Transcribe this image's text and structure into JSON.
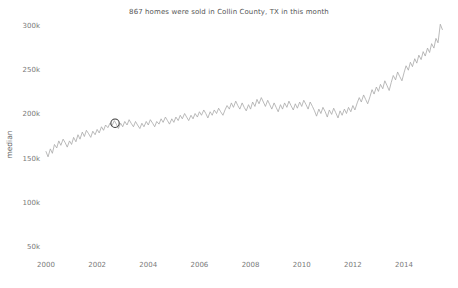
{
  "chart_data": {
    "type": "line",
    "title": "867 homes were sold in Collin County, TX in this month",
    "xlabel": "",
    "ylabel": "median",
    "grid": false,
    "legend": null,
    "xlim": [
      2000.0,
      2015.6
    ],
    "ylim": [
      50000,
      310000
    ],
    "ytick_labels": [
      "300k",
      "250k",
      "200k",
      "150k",
      "100k",
      "50k"
    ],
    "ytick_values": [
      300000,
      250000,
      200000,
      150000,
      100000,
      50000
    ],
    "xtick_labels": [
      "2000",
      "2002",
      "2004",
      "2006",
      "2008",
      "2010",
      "2012",
      "2014"
    ],
    "xtick_values": [
      2000,
      2002,
      2004,
      2006,
      2008,
      2010,
      2012,
      2014
    ],
    "line_color": "#a8a8a8",
    "marker_color": "#3b3b3b",
    "title_color": "#555555",
    "tick_color": "#7a7a7a",
    "highlight_point": {
      "x": 2002.7,
      "y": 190000,
      "shape": "open-circle"
    },
    "x": [
      2000.0,
      2000.08,
      2000.17,
      2000.25,
      2000.33,
      2000.42,
      2000.5,
      2000.58,
      2000.67,
      2000.75,
      2000.83,
      2000.92,
      2001.0,
      2001.08,
      2001.17,
      2001.25,
      2001.33,
      2001.42,
      2001.5,
      2001.58,
      2001.67,
      2001.75,
      2001.83,
      2001.92,
      2002.0,
      2002.08,
      2002.17,
      2002.25,
      2002.33,
      2002.42,
      2002.5,
      2002.58,
      2002.67,
      2002.75,
      2002.83,
      2002.92,
      2003.0,
      2003.08,
      2003.17,
      2003.25,
      2003.33,
      2003.42,
      2003.5,
      2003.58,
      2003.67,
      2003.75,
      2003.83,
      2003.92,
      2004.0,
      2004.08,
      2004.17,
      2004.25,
      2004.33,
      2004.42,
      2004.5,
      2004.58,
      2004.67,
      2004.75,
      2004.83,
      2004.92,
      2005.0,
      2005.08,
      2005.17,
      2005.25,
      2005.33,
      2005.42,
      2005.5,
      2005.58,
      2005.67,
      2005.75,
      2005.83,
      2005.92,
      2006.0,
      2006.08,
      2006.17,
      2006.25,
      2006.33,
      2006.42,
      2006.5,
      2006.58,
      2006.67,
      2006.75,
      2006.83,
      2006.92,
      2007.0,
      2007.08,
      2007.17,
      2007.25,
      2007.33,
      2007.42,
      2007.5,
      2007.58,
      2007.67,
      2007.75,
      2007.83,
      2007.92,
      2008.0,
      2008.08,
      2008.17,
      2008.25,
      2008.33,
      2008.42,
      2008.5,
      2008.58,
      2008.67,
      2008.75,
      2008.83,
      2008.92,
      2009.0,
      2009.08,
      2009.17,
      2009.25,
      2009.33,
      2009.42,
      2009.5,
      2009.58,
      2009.67,
      2009.75,
      2009.83,
      2009.92,
      2010.0,
      2010.08,
      2010.17,
      2010.25,
      2010.33,
      2010.42,
      2010.5,
      2010.58,
      2010.67,
      2010.75,
      2010.83,
      2010.92,
      2011.0,
      2011.08,
      2011.17,
      2011.25,
      2011.33,
      2011.42,
      2011.5,
      2011.58,
      2011.67,
      2011.75,
      2011.83,
      2011.92,
      2012.0,
      2012.08,
      2012.17,
      2012.25,
      2012.33,
      2012.42,
      2012.5,
      2012.58,
      2012.67,
      2012.75,
      2012.83,
      2012.92,
      2013.0,
      2013.08,
      2013.17,
      2013.25,
      2013.33,
      2013.42,
      2013.5,
      2013.58,
      2013.67,
      2013.75,
      2013.83,
      2013.92,
      2014.0,
      2014.08,
      2014.17,
      2014.25,
      2014.33,
      2014.42,
      2014.5,
      2014.58,
      2014.67,
      2014.75,
      2014.83,
      2014.92,
      2015.0,
      2015.08,
      2015.17,
      2015.25,
      2015.33,
      2015.42,
      2015.5
    ],
    "y": [
      158000,
      152000,
      161000,
      156000,
      166000,
      162000,
      170000,
      165000,
      172000,
      168000,
      163000,
      170000,
      166000,
      174000,
      169000,
      177000,
      172000,
      180000,
      175000,
      182000,
      178000,
      174000,
      181000,
      177000,
      183000,
      179000,
      186000,
      182000,
      188000,
      185000,
      190000,
      187000,
      193000,
      189000,
      184000,
      190000,
      186000,
      192000,
      188000,
      194000,
      190000,
      186000,
      192000,
      188000,
      184000,
      190000,
      186000,
      192000,
      188000,
      194000,
      190000,
      186000,
      192000,
      189000,
      195000,
      191000,
      197000,
      193000,
      189000,
      195000,
      191000,
      197000,
      193000,
      199000,
      195000,
      201000,
      197000,
      193000,
      199000,
      195000,
      201000,
      197000,
      203000,
      199000,
      205000,
      201000,
      196000,
      203000,
      199000,
      205000,
      201000,
      207000,
      203000,
      199000,
      205000,
      210000,
      206000,
      213000,
      208000,
      215000,
      210000,
      206000,
      213000,
      208000,
      204000,
      211000,
      206000,
      214000,
      209000,
      217000,
      212000,
      219000,
      214000,
      209000,
      216000,
      211000,
      206000,
      213000,
      208000,
      203000,
      211000,
      206000,
      213000,
      208000,
      215000,
      210000,
      205000,
      212000,
      207000,
      214000,
      209000,
      216000,
      211000,
      206000,
      214000,
      209000,
      204000,
      198000,
      206000,
      201000,
      208000,
      203000,
      197000,
      205000,
      200000,
      207000,
      202000,
      196000,
      204000,
      199000,
      206000,
      201000,
      208000,
      203000,
      210000,
      205000,
      213000,
      219000,
      214000,
      222000,
      217000,
      212000,
      220000,
      228000,
      223000,
      231000,
      226000,
      234000,
      229000,
      238000,
      233000,
      227000,
      236000,
      244000,
      239000,
      248000,
      243000,
      238000,
      247000,
      255000,
      250000,
      259000,
      254000,
      263000,
      258000,
      267000,
      262000,
      271000,
      266000,
      275000,
      270000,
      280000,
      275000,
      286000,
      281000,
      302000,
      296000
    ]
  }
}
